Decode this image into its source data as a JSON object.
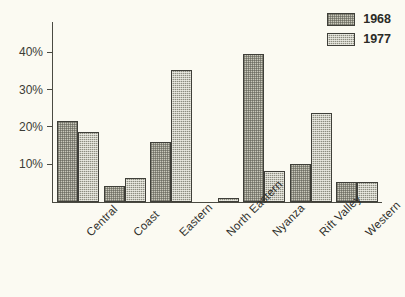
{
  "chart_data": {
    "type": "bar",
    "title": "",
    "subtitle": "",
    "xlabel": "",
    "ylabel": "",
    "ylim": [
      0,
      44
    ],
    "grid": false,
    "legend_position": "top-right",
    "tick_suffix": "%",
    "yticks": [
      "10%",
      "20%",
      "30%",
      "40%"
    ],
    "ytick_values": [
      10,
      20,
      30,
      40
    ],
    "categories": [
      "Central",
      "Coast",
      "Eastern",
      "North Eastern",
      "Nyanza",
      "Rift Valley",
      "Western"
    ],
    "series": [
      {
        "name": "1968",
        "values": [
          21.7,
          4.3,
          16.2,
          0,
          39.6,
          10.3,
          5.5
        ]
      },
      {
        "name": "1977",
        "values": [
          18.7,
          6.5,
          35.5,
          1.2,
          8.3,
          24.0,
          5.5
        ]
      }
    ]
  },
  "legend": {
    "items": [
      {
        "label": "1968",
        "swatch": "light-hatch-swatch"
      },
      {
        "label": "1977",
        "swatch": "dark-hatch-swatch"
      }
    ]
  },
  "colors": {
    "background": "#fbfaf2",
    "axis": "#4a4a42",
    "series_1968": "#c9c8bb",
    "series_1977": "#8d8d80",
    "bar_outline": "#3f3f39",
    "text": "#2f2f2b"
  }
}
